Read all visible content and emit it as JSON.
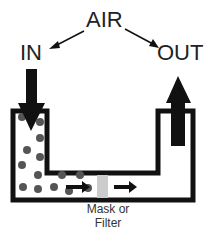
{
  "labels": {
    "air": "AIR",
    "in": "IN",
    "out": "OUT",
    "filter_line1": "Mask or",
    "filter_line2": "Filter"
  },
  "colors": {
    "outline": "#111111",
    "filter": "#cccccc",
    "particle": "#555555",
    "background": "#ffffff"
  },
  "icons": [
    "arrow-in-down-icon",
    "arrow-out-up-icon",
    "air-to-in-arrow-icon",
    "air-to-out-arrow-icon",
    "flow-arrow-icon",
    "particle-icon"
  ]
}
